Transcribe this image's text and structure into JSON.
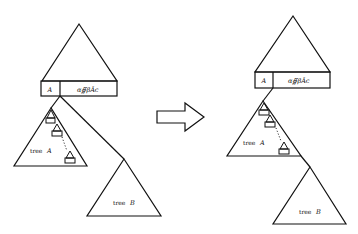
{
  "diagram": {
    "before": {
      "node_label": "A",
      "node_string": "α∯βÂc",
      "tree_a_label": "tree",
      "tree_a_var": "A",
      "tree_b_label": "tree",
      "tree_b_var": "B"
    },
    "after": {
      "node_label": "A",
      "node_string": "α∯βÂc",
      "tree_a_label": "tree",
      "tree_a_var": "A",
      "tree_b_label": "tree",
      "tree_b_var": "B"
    },
    "arrow": "right-arrow",
    "colors": {
      "stroke": "#111111",
      "background": "#ffffff"
    }
  }
}
